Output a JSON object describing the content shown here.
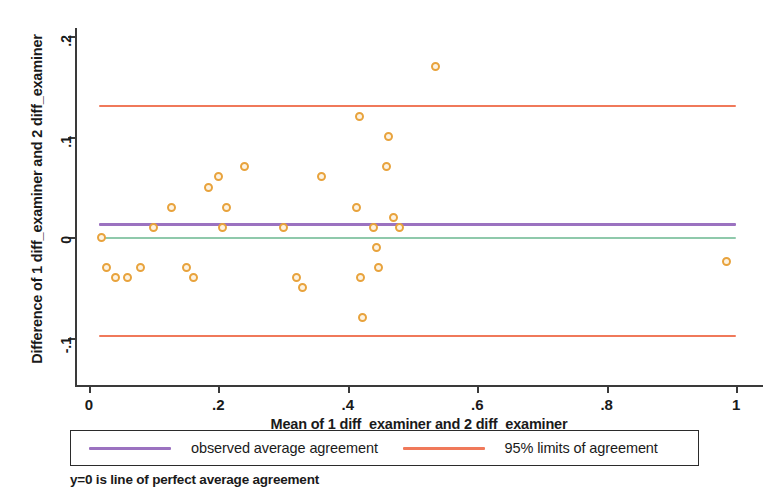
{
  "axes": {
    "ylabel": "Difference of 1 diff_examiner and 2 diff_examiner",
    "xlabel": "Mean of 1 diff_examiner and 2 diff_examiner"
  },
  "legend": {
    "items": [
      {
        "label": "observed average agreement",
        "color": "#9b72c0"
      },
      {
        "label": "95% limits of agreement",
        "color": "#f0795a"
      }
    ]
  },
  "caption": "y=0 is line of perfect average agreement",
  "chart_data": {
    "type": "scatter",
    "title": "",
    "xlabel": "Mean of 1 diff_examiner and 2 diff_examiner",
    "ylabel": "Difference of 1 diff_examiner and 2 diff_examiner",
    "xlim": [
      -0.02,
      1.04
    ],
    "ylim": [
      -0.115,
      0.215
    ],
    "xticks": [
      0,
      0.2,
      0.4,
      0.6,
      0.8,
      1
    ],
    "xticklabels": [
      "0",
      ".2",
      ".4",
      ".6",
      ".8",
      "1"
    ],
    "yticks": [
      0.2,
      0.1,
      0,
      -0.1
    ],
    "yticklabels": [
      ".2",
      ".1",
      "0",
      "-.1"
    ],
    "grid": false,
    "legend_position": "below-axes",
    "marker": {
      "shape": "circle-open",
      "color": "#e8a33d",
      "size": 9
    },
    "series": [
      {
        "name": "differences",
        "points": [
          [
            0.02,
            0.0
          ],
          [
            0.027,
            -0.03
          ],
          [
            0.041,
            -0.04
          ],
          [
            0.06,
            -0.04
          ],
          [
            0.08,
            -0.03
          ],
          [
            0.1,
            0.01
          ],
          [
            0.128,
            0.03
          ],
          [
            0.15,
            -0.03
          ],
          [
            0.162,
            -0.04
          ],
          [
            0.185,
            0.05
          ],
          [
            0.2,
            0.06
          ],
          [
            0.207,
            0.01
          ],
          [
            0.213,
            0.03
          ],
          [
            0.24,
            0.07
          ],
          [
            0.3,
            0.01
          ],
          [
            0.32,
            -0.04
          ],
          [
            0.33,
            -0.05
          ],
          [
            0.36,
            0.06
          ],
          [
            0.413,
            0.03
          ],
          [
            0.418,
            0.12
          ],
          [
            0.42,
            -0.04
          ],
          [
            0.422,
            -0.08
          ],
          [
            0.44,
            0.01
          ],
          [
            0.444,
            -0.01
          ],
          [
            0.448,
            -0.03
          ],
          [
            0.46,
            0.07
          ],
          [
            0.463,
            0.1
          ],
          [
            0.47,
            0.02
          ],
          [
            0.48,
            0.01
          ],
          [
            0.535,
            0.17
          ],
          [
            0.985,
            -0.024
          ]
        ]
      }
    ],
    "reference_lines": [
      {
        "name": "upper-limit-of-agreement",
        "value": 0.132,
        "color": "#f0795a"
      },
      {
        "name": "observed-average-agreement",
        "value": 0.014,
        "color": "#9b72c0"
      },
      {
        "name": "perfect-agreement-zero-line",
        "value": 0.0,
        "color": "#8fc9ab"
      },
      {
        "name": "lower-limit-of-agreement",
        "value": -0.097,
        "color": "#f0795a"
      }
    ]
  }
}
